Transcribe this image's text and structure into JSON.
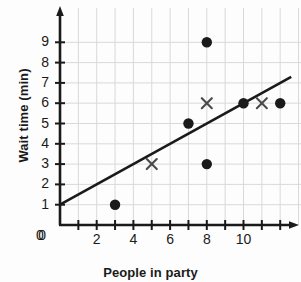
{
  "chart_data": {
    "type": "scatter",
    "title": "",
    "xlabel": "People in party",
    "ylabel": "Wait time (min)",
    "xlim": [
      0,
      12.6
    ],
    "ylim": [
      0,
      9.6
    ],
    "grid": true,
    "legend": null,
    "x_ticks": [
      0,
      1,
      2,
      3,
      4,
      5,
      6,
      7,
      8,
      9,
      10,
      11,
      12
    ],
    "x_tick_labels": [
      "0",
      "",
      "2",
      "",
      "4",
      "",
      "6",
      "",
      "8",
      "",
      "10",
      "",
      ""
    ],
    "y_ticks": [
      0,
      1,
      2,
      3,
      4,
      5,
      6,
      7,
      8,
      9
    ],
    "y_tick_labels": [
      "0",
      "1",
      "2",
      "3",
      "4",
      "5",
      "6",
      "7",
      "8",
      "9"
    ],
    "series": [
      {
        "name": "data-points",
        "marker": "filled-circle",
        "color": "#1a1a1a",
        "points": [
          {
            "x": 3,
            "y": 1
          },
          {
            "x": 7,
            "y": 5
          },
          {
            "x": 8,
            "y": 9
          },
          {
            "x": 8,
            "y": 3
          },
          {
            "x": 10,
            "y": 6
          },
          {
            "x": 12,
            "y": 6
          }
        ]
      },
      {
        "name": "x-markers",
        "marker": "x-cross",
        "color": "#4a4a4a",
        "points": [
          {
            "x": 5,
            "y": 3
          },
          {
            "x": 8,
            "y": 6
          },
          {
            "x": 11,
            "y": 6
          }
        ]
      }
    ],
    "trend_line": {
      "name": "line-of-best-fit",
      "color": "#1a1a1a",
      "x_start": 0,
      "y_start": 1,
      "x_end": 12.6,
      "y_end": 7.3
    }
  },
  "axes": {
    "x_title": "People in party",
    "y_title": "Wait time (min)"
  }
}
